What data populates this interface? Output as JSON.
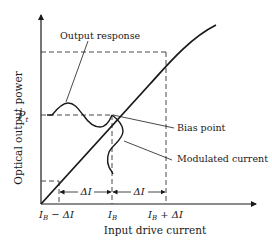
{
  "diagram": {
    "y_axis_label": "Optical output power",
    "x_axis_label": "Input drive current",
    "level_label": "P",
    "level_subscript": "t",
    "annotations": {
      "output_response": "Output response",
      "bias_point": "Bias point",
      "modulated_current": "Modulated current"
    },
    "x_ticks": {
      "left_main": "I",
      "left_sub": "B",
      "left_tail": " − ΔI",
      "mid_main": "I",
      "mid_sub": "B",
      "right_main": "I",
      "right_sub": "B",
      "right_tail": " + ΔI"
    },
    "delta_labels": {
      "left": "ΔI",
      "right": "ΔI"
    },
    "colors": {
      "ink": "#1a1a1a",
      "background": "#ffffff"
    }
  }
}
